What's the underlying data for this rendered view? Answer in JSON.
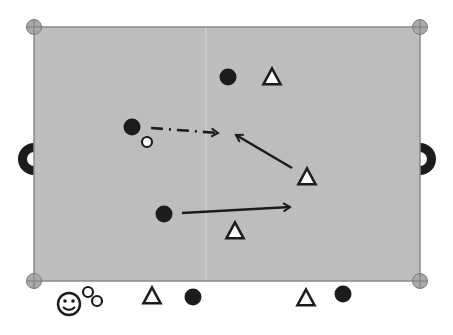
{
  "diagram": {
    "type": "sports-drill",
    "colors": {
      "background": "#ffffff",
      "field": "#bdbdbd",
      "field_border": "#8a8a8a",
      "center_line": "#d2d2d2",
      "marker_fill": "#a9a9a9",
      "marker_stroke": "#7a7a7a",
      "player_dark": "#1c1c1c",
      "player_light": "#ffffff",
      "ink": "#1c1c1c"
    },
    "field": {
      "x": 34,
      "y": 27,
      "width": 386,
      "height": 254,
      "center_line_x": 206
    },
    "corner_markers": [
      {
        "x": 34,
        "y": 27
      },
      {
        "x": 420,
        "y": 27
      },
      {
        "x": 34,
        "y": 281
      },
      {
        "x": 420,
        "y": 281
      }
    ],
    "goals": [
      {
        "side": "left",
        "x": 34,
        "y": 159
      },
      {
        "side": "right",
        "x": 420,
        "y": 159
      }
    ],
    "dark_players": [
      {
        "x": 228,
        "y": 77
      },
      {
        "x": 132,
        "y": 127
      },
      {
        "x": 164,
        "y": 214
      },
      {
        "x": 193,
        "y": 297
      },
      {
        "x": 343,
        "y": 294
      }
    ],
    "triangle_players": [
      {
        "x": 272,
        "y": 77
      },
      {
        "x": 307,
        "y": 177
      },
      {
        "x": 235,
        "y": 231
      },
      {
        "x": 152,
        "y": 296
      },
      {
        "x": 306,
        "y": 298
      }
    ],
    "balls": [
      {
        "x": 147,
        "y": 142
      },
      {
        "x": 88,
        "y": 292
      },
      {
        "x": 97,
        "y": 301
      }
    ],
    "arrows": [
      {
        "kind": "pass",
        "style": "dash-dot",
        "x1": 151,
        "y1": 128,
        "x2": 218,
        "y2": 133
      },
      {
        "kind": "run",
        "style": "solid",
        "x1": 292,
        "y1": 168,
        "x2": 236,
        "y2": 135
      },
      {
        "kind": "run",
        "style": "solid",
        "x1": 182,
        "y1": 213,
        "x2": 290,
        "y2": 207
      }
    ],
    "coach": {
      "icon": "smiley-face-icon",
      "x": 69,
      "y": 304
    }
  }
}
